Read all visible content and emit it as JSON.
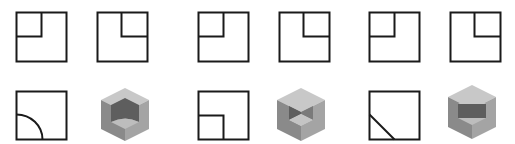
{
  "colors": {
    "line": "#1a1a1a",
    "background": "#ffffff",
    "cube_top": "#c8c8c8",
    "cube_left": "#8a8a8a",
    "cube_right": "#a4a4a4",
    "cube_inner_dark": "#5e5e5e",
    "cube_inner_mid": "#7a7a7a",
    "cube_inner_light": "#bdbdbd"
  },
  "groups": [
    {
      "id": "group-1",
      "front_view": "square-notch-top-left",
      "side_view": "square-notch-top-right",
      "top_view": "square-quarter-arc-bottom-left",
      "solid": "cube-with-cylindrical-cutout"
    },
    {
      "id": "group-2",
      "front_view": "square-notch-top-left",
      "side_view": "square-notch-top-right",
      "top_view": "square-notch-bottom-left",
      "solid": "cube-with-corner-cutout"
    },
    {
      "id": "group-3",
      "front_view": "square-notch-top-left",
      "side_view": "square-notch-top-right",
      "top_view": "square-diagonal-cut-bottom-left",
      "solid": "cube-with-triangular-prism-cutout"
    }
  ]
}
